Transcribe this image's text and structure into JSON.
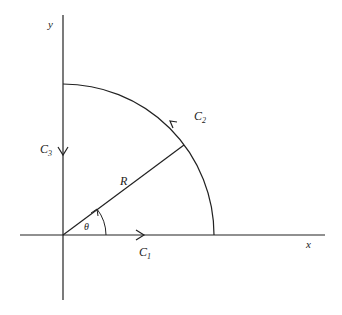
{
  "diagram": {
    "type": "contour-integration-quarter-circle",
    "axes": {
      "x_label": "x",
      "y_label": "y"
    },
    "contours": [
      {
        "name": "C",
        "subscript": "1",
        "description": "along positive x-axis from origin to R, arrow pointing right"
      },
      {
        "name": "C",
        "subscript": "2",
        "description": "quarter-circle arc of radius R, counter-clockwise from x-axis to y-axis"
      },
      {
        "name": "C",
        "subscript": "3",
        "description": "along y-axis from iR down to origin, arrow pointing down"
      }
    ],
    "radius_label": "R",
    "angle_label": "θ",
    "colors": {
      "stroke": "#222222",
      "background": "#ffffff"
    }
  }
}
